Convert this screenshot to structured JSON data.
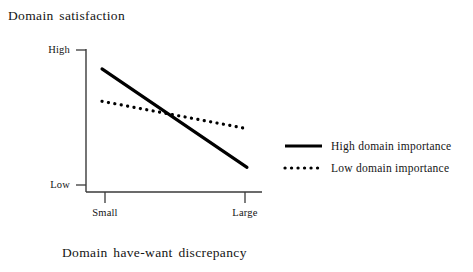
{
  "chart_data": {
    "type": "line",
    "title": "Domain satisfaction",
    "xlabel": "Domain have-want discrepancy",
    "ylabel": "Domain satisfaction",
    "grid": false,
    "legend_position": "right",
    "x": [
      "Small",
      "Large"
    ],
    "xtick_labels": [
      "Small",
      "Large"
    ],
    "ytick_labels": [
      "High",
      "Low"
    ],
    "xlim": [
      "Small",
      "Large"
    ],
    "ylim": [
      "Low",
      "High"
    ],
    "series": [
      {
        "name": "High domain importance",
        "style": "solid",
        "color": "#000000",
        "values": [
          0.86,
          0.13
        ]
      },
      {
        "name": "Low domain importance",
        "style": "dotted",
        "color": "#000000",
        "values": [
          0.62,
          0.42
        ]
      }
    ],
    "annotations": [
      "Lines cross at an intermediate level of have-want discrepancy"
    ]
  },
  "figure": {
    "title": "Domain satisfaction",
    "xaxis_title": "Domain have-want discrepancy",
    "ytick_high": "High",
    "ytick_low": "Low",
    "xtick_small": "Small",
    "xtick_large": "Large"
  },
  "legend": {
    "entries": [
      {
        "label": "High domain importance",
        "style": "solid"
      },
      {
        "label": "Low domain importance",
        "style": "dotted"
      }
    ]
  },
  "colors": {
    "background": "#ffffff",
    "ink": "#141414",
    "axis": "#3a3a3a",
    "series": "#000000"
  }
}
